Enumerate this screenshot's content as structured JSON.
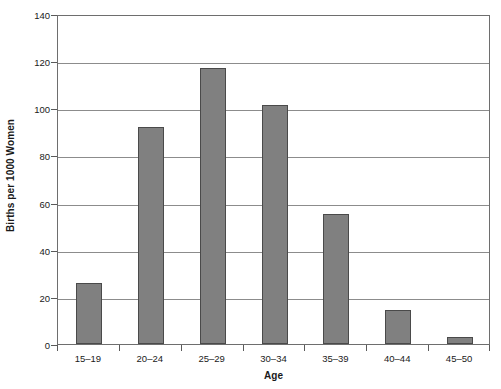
{
  "chart_data": {
    "type": "bar",
    "title": "",
    "subtitle": "",
    "xlabel": "Age",
    "ylabel": "Births per 1000 Women",
    "categories": [
      "15–19",
      "20–24",
      "25–29",
      "30–34",
      "35–39",
      "40–44",
      "45–50"
    ],
    "values": [
      26,
      92,
      117,
      101.5,
      55,
      14.5,
      3
    ],
    "series": [
      {
        "name": "Births per 1000 Women",
        "values": [
          26,
          92,
          117,
          101.5,
          55,
          14.5,
          3
        ]
      }
    ],
    "ylim": [
      0,
      140
    ],
    "ytick_values": [
      0,
      20,
      40,
      60,
      80,
      100,
      120,
      140
    ],
    "ytick_labels": [
      "0",
      "20",
      "40",
      "60",
      "80",
      "100",
      "120",
      "140"
    ],
    "grid": true,
    "grid_axis": "y",
    "legend": false,
    "legend_position": "none",
    "annotations": [],
    "bar_color": "#808080",
    "bar_edge_color": "#4a4a4a",
    "gridline_color": "#8c8c8c",
    "axis_color": "#6e6e6e",
    "background_color": "#ffffff"
  }
}
